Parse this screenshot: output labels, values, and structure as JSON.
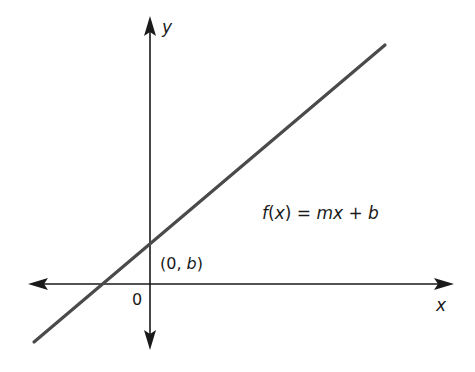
{
  "diagram": {
    "axes": {
      "x_label": "x",
      "y_label": "y",
      "origin_label": "0"
    },
    "equation": {
      "f": "f",
      "open": "(",
      "var": "x",
      "close": ")",
      "eq": " = ",
      "m": "mx",
      "plus": " + ",
      "b": "b"
    },
    "intercept": {
      "open": "(0, ",
      "b": "b",
      "close": ")"
    },
    "colors": {
      "axis": "#1a1a1a",
      "line": "#4a4a4a",
      "text": "#1a1a1a"
    }
  }
}
